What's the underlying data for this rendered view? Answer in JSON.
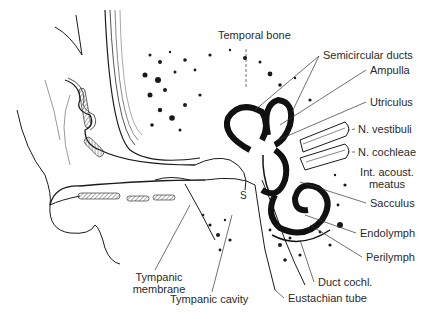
{
  "figure": {
    "labels": [
      {
        "id": "temporal-bone",
        "text": "Temporal bone",
        "x": 218,
        "y": 35
      },
      {
        "id": "semicircular-ducts",
        "text": "Semicircular ducts",
        "x": 323,
        "y": 50
      },
      {
        "id": "ampulla",
        "text": "Ampulla",
        "x": 370,
        "y": 65
      },
      {
        "id": "utriculus",
        "text": "Utriculus",
        "x": 370,
        "y": 97
      },
      {
        "id": "n-vestibuli",
        "text": "N. vestibuli",
        "x": 358,
        "y": 124
      },
      {
        "id": "n-cochleae",
        "text": "N. cochleae",
        "x": 358,
        "y": 147
      },
      {
        "id": "int-acoust-meatus",
        "text": "Int. acoust.\nmeatus",
        "x": 360,
        "y": 167
      },
      {
        "id": "sacculus",
        "text": "Sacculus",
        "x": 370,
        "y": 198
      },
      {
        "id": "endolymph",
        "text": "Endolymph",
        "x": 360,
        "y": 228
      },
      {
        "id": "perilymph",
        "text": "Perilymph",
        "x": 366,
        "y": 252
      },
      {
        "id": "duct-cochl",
        "text": "Duct cochl.",
        "x": 318,
        "y": 277
      },
      {
        "id": "eustachian-tube",
        "text": "Eustachian tube",
        "x": 288,
        "y": 293
      },
      {
        "id": "tympanic-membrane",
        "text": "Tympanic\nmembrane",
        "x": 128,
        "y": 272
      },
      {
        "id": "tympanic-cavity",
        "text": "Tympanic cavity",
        "x": 170,
        "y": 294
      },
      {
        "id": "stapes-marker",
        "text": "S",
        "x": 240,
        "y": 193
      }
    ],
    "colors": {
      "ink": "#1a1a1a",
      "text": "#2a2a2a",
      "background": "#ffffff",
      "hatch": "#777777"
    }
  }
}
